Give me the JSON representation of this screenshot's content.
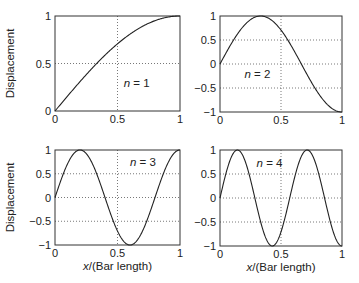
{
  "chart_data": [
    {
      "type": "line",
      "label": "n = 1",
      "title": "",
      "xlabel": "",
      "ylabel": "Displacement",
      "xlim": [
        0,
        1
      ],
      "ylim": [
        0,
        1
      ],
      "xticks": [
        "0",
        "0.5",
        "1"
      ],
      "yticks": [
        "0",
        "0.5",
        "1"
      ],
      "grid": "dotted",
      "x": [
        0,
        0.1,
        0.2,
        0.3,
        0.4,
        0.5,
        0.6,
        0.7,
        0.8,
        0.9,
        1.0
      ],
      "values": [
        0,
        0.156,
        0.309,
        0.454,
        0.588,
        0.707,
        0.809,
        0.891,
        0.951,
        0.988,
        1.0
      ]
    },
    {
      "type": "line",
      "label": "n = 2",
      "title": "",
      "xlabel": "",
      "ylabel": "",
      "xlim": [
        0,
        1
      ],
      "ylim": [
        -1,
        1
      ],
      "xticks": [
        "0",
        "0.5",
        "1"
      ],
      "yticks": [
        "−1",
        "−0.5",
        "0",
        "0.5",
        "1"
      ],
      "grid": "dotted",
      "x": [
        0,
        0.1,
        0.2,
        0.333,
        0.4,
        0.5,
        0.6,
        0.7,
        0.8,
        0.9,
        1.0
      ],
      "values": [
        0,
        0.454,
        0.809,
        1.0,
        0.951,
        0.707,
        0.309,
        -0.156,
        -0.588,
        -0.891,
        -1.0
      ]
    },
    {
      "type": "line",
      "label": "n = 3",
      "title": "",
      "xlabel": "x/(Bar length)",
      "ylabel": "Displacement",
      "xlim": [
        0,
        1
      ],
      "ylim": [
        -1,
        1
      ],
      "xticks": [
        "0",
        "0.5",
        "1"
      ],
      "yticks": [
        "−1",
        "−0.5",
        "0",
        "0.5",
        "1"
      ],
      "grid": "dotted",
      "x": [
        0,
        0.1,
        0.2,
        0.3,
        0.4,
        0.5,
        0.6,
        0.7,
        0.8,
        0.9,
        1.0
      ],
      "values": [
        0,
        0.707,
        1.0,
        0.707,
        0,
        -0.707,
        -1.0,
        -0.707,
        0,
        0.707,
        1.0
      ]
    },
    {
      "type": "line",
      "label": "n = 4",
      "title": "",
      "xlabel": "x/(Bar length)",
      "ylabel": "",
      "xlim": [
        0,
        1
      ],
      "ylim": [
        -1,
        1
      ],
      "xticks": [
        "0",
        "0.5",
        "1"
      ],
      "yticks": [
        "−1",
        "−0.5",
        "0",
        "0.5",
        "1"
      ],
      "grid": "dotted",
      "x": [
        0,
        0.143,
        0.286,
        0.429,
        0.571,
        0.714,
        0.857,
        1.0
      ],
      "values": [
        0,
        1.0,
        0,
        -1.0,
        0,
        1.0,
        0,
        -1.0
      ]
    }
  ],
  "panels": [
    {
      "label_prefix": "n",
      "label_value": "= 1"
    },
    {
      "label_prefix": "n",
      "label_value": "= 2"
    },
    {
      "label_prefix": "n",
      "label_value": "= 3"
    },
    {
      "label_prefix": "n",
      "label_value": "= 4"
    }
  ],
  "axes": {
    "ylabel": "Displacement",
    "xlabel_italic": "x",
    "xlabel_rest": "/(Bar length)",
    "ticks": {
      "x": [
        "0",
        "0.5",
        "1"
      ],
      "y01": [
        "0",
        "0.5",
        "1"
      ],
      "ym11": [
        "−1",
        "−0.5",
        "0",
        "0.5",
        "1"
      ]
    }
  },
  "colors": {
    "line": "#222222",
    "grid": "#555555",
    "axes": "#333333"
  }
}
